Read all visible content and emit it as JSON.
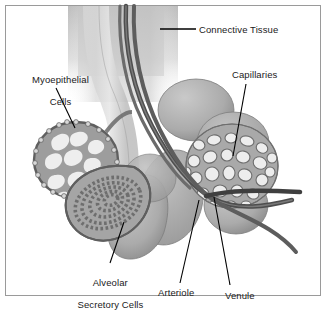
{
  "figure": {
    "background_color": "#ffffff",
    "border_color": "#9a9a9a",
    "label_color": "#1a1a1a",
    "leader_line_color": "#000000",
    "palette": {
      "tissue_light": "#d8d8d8",
      "tissue_mid": "#b4b4b4",
      "tissue_dark": "#8f8f8f",
      "vessel_dark": "#555555",
      "vessel_mid": "#777777",
      "cell_fill": "#f0f0f0",
      "connective_gradient": "#cfcfcf"
    }
  },
  "labels": [
    {
      "id": "connective-tissue",
      "text": "Connective Tissue",
      "lines": [
        "Connective Tissue"
      ],
      "x": 199,
      "y": 24,
      "align": "left",
      "leader": {
        "x1": 196,
        "y1": 29,
        "x2": 160,
        "y2": 29,
        "style": "straight-horizontal"
      }
    },
    {
      "id": "myoepithelial-cells",
      "text": "Myoepithelial Cells",
      "lines": [
        "Myoepithelial",
        "Cells"
      ],
      "x": 10,
      "y": 63,
      "align": "center",
      "leader": {
        "x1": 56,
        "y1": 88,
        "x2": 75,
        "y2": 128,
        "style": "straight-diagonal"
      }
    },
    {
      "id": "capillaries",
      "text": "Capillaries",
      "lines": [
        "Capillaries"
      ],
      "x": 232,
      "y": 69,
      "align": "left",
      "leader": {
        "x1": 246,
        "y1": 84,
        "x2": 233,
        "y2": 156,
        "style": "straight-diagonal"
      }
    },
    {
      "id": "alveolar-secretory-cells",
      "text": "Alveolar Secretory Cells",
      "lines": [
        "Alveolar",
        "Secretory Cells"
      ],
      "x": 64,
      "y": 266,
      "align": "center",
      "leader": {
        "x1": 110,
        "y1": 263,
        "x2": 124,
        "y2": 222,
        "style": "straight-diagonal"
      }
    },
    {
      "id": "arteriole",
      "text": "Arteriole",
      "lines": [
        "Arteriole"
      ],
      "x": 158,
      "y": 287,
      "align": "left",
      "leader": {
        "x1": 180,
        "y1": 283,
        "x2": 199,
        "y2": 200,
        "style": "straight-diagonal"
      }
    },
    {
      "id": "venule",
      "text": "Venule",
      "lines": [
        "Venule"
      ],
      "x": 225,
      "y": 290,
      "align": "left",
      "leader": {
        "x1": 230,
        "y1": 285,
        "x2": 214,
        "y2": 197,
        "style": "straight-diagonal"
      }
    }
  ],
  "structures": [
    {
      "id": "connective-tissue-column",
      "kind": "gradient-column",
      "note": "soft gray vertical band at top of figure"
    },
    {
      "id": "duct",
      "kind": "tube",
      "note": "pale central duct descending from connective tissue"
    },
    {
      "id": "arteriole-vessel",
      "kind": "vessel",
      "note": "long dark vessel descending left of duct and curving right"
    },
    {
      "id": "venule-vessel",
      "kind": "vessel",
      "note": "second dark vessel parallel to arteriole exiting right edge"
    },
    {
      "id": "myoepithelial-alveolus",
      "kind": "alveolus",
      "note": "left alveolus with basket of myoepithelial cells"
    },
    {
      "id": "secretory-alveolus",
      "kind": "alveolus",
      "note": "teardrop alveolus with concentric rings of secretory cells"
    },
    {
      "id": "capillary-alveolus",
      "kind": "alveolus",
      "note": "right alveolus covered by capillary mesh"
    },
    {
      "id": "plain-alveoli-cluster",
      "kind": "alveoli",
      "note": "cluster of smooth gray alveoli"
    }
  ]
}
